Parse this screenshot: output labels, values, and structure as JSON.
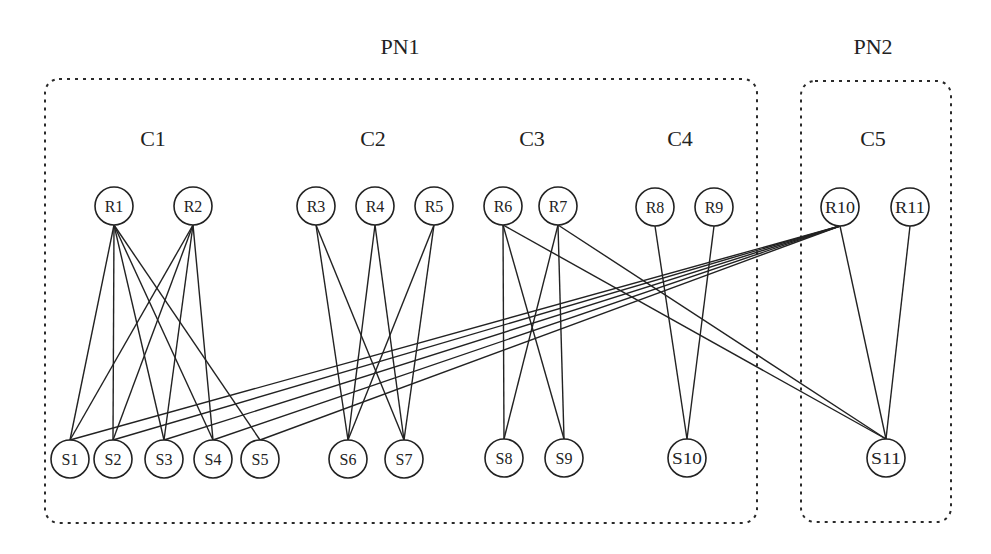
{
  "diagram": {
    "groups": [
      {
        "id": "PN1",
        "label": "PN1",
        "x": 45,
        "y": 79,
        "w": 712,
        "h": 444,
        "label_x": 400,
        "label_y": 54
      },
      {
        "id": "PN2",
        "label": "PN2",
        "x": 801,
        "y": 81,
        "w": 150,
        "h": 441,
        "label_x": 873,
        "label_y": 54
      }
    ],
    "clusters": [
      {
        "id": "C1",
        "label": "C1",
        "x": 153,
        "y": 146
      },
      {
        "id": "C2",
        "label": "C2",
        "x": 373,
        "y": 146
      },
      {
        "id": "C3",
        "label": "C3",
        "x": 532,
        "y": 146
      },
      {
        "id": "C4",
        "label": "C4",
        "x": 680,
        "y": 146
      },
      {
        "id": "C5",
        "label": "C5",
        "x": 873,
        "y": 146
      }
    ],
    "node_radius": 19,
    "nodes": [
      {
        "id": "R1",
        "label": "R1",
        "x": 114,
        "y": 206
      },
      {
        "id": "R2",
        "label": "R2",
        "x": 193,
        "y": 206
      },
      {
        "id": "R3",
        "label": "R3",
        "x": 316,
        "y": 206
      },
      {
        "id": "R4",
        "label": "R4",
        "x": 375,
        "y": 206
      },
      {
        "id": "R5",
        "label": "R5",
        "x": 434,
        "y": 206
      },
      {
        "id": "R6",
        "label": "R6",
        "x": 503,
        "y": 206
      },
      {
        "id": "R7",
        "label": "R7",
        "x": 558,
        "y": 206
      },
      {
        "id": "R8",
        "label": "R8",
        "x": 655,
        "y": 207
      },
      {
        "id": "R9",
        "label": "R9",
        "x": 714,
        "y": 207
      },
      {
        "id": "R10",
        "label": "R10",
        "x": 840,
        "y": 207
      },
      {
        "id": "R11",
        "label": "R11",
        "x": 910,
        "y": 207
      },
      {
        "id": "S1",
        "label": "S1",
        "x": 70,
        "y": 459
      },
      {
        "id": "S2",
        "label": "S2",
        "x": 113,
        "y": 459
      },
      {
        "id": "S3",
        "label": "S3",
        "x": 164,
        "y": 459
      },
      {
        "id": "S4",
        "label": "S4",
        "x": 213,
        "y": 459
      },
      {
        "id": "S5",
        "label": "S5",
        "x": 260,
        "y": 459
      },
      {
        "id": "S6",
        "label": "S6",
        "x": 348,
        "y": 459
      },
      {
        "id": "S7",
        "label": "S7",
        "x": 404,
        "y": 459
      },
      {
        "id": "S8",
        "label": "S8",
        "x": 504,
        "y": 458
      },
      {
        "id": "S9",
        "label": "S9",
        "x": 564,
        "y": 458
      },
      {
        "id": "S10",
        "label": "S10",
        "x": 687,
        "y": 458
      },
      {
        "id": "S11",
        "label": "S11",
        "x": 886,
        "y": 458
      }
    ],
    "edges": [
      [
        "R1",
        "S1"
      ],
      [
        "R1",
        "S2"
      ],
      [
        "R1",
        "S3"
      ],
      [
        "R1",
        "S4"
      ],
      [
        "R1",
        "S5"
      ],
      [
        "R2",
        "S1"
      ],
      [
        "R2",
        "S2"
      ],
      [
        "R2",
        "S3"
      ],
      [
        "R2",
        "S4"
      ],
      [
        "R3",
        "S6"
      ],
      [
        "R3",
        "S7"
      ],
      [
        "R4",
        "S6"
      ],
      [
        "R4",
        "S7"
      ],
      [
        "R5",
        "S6"
      ],
      [
        "R5",
        "S7"
      ],
      [
        "R6",
        "S8"
      ],
      [
        "R6",
        "S9"
      ],
      [
        "R6",
        "S11"
      ],
      [
        "R7",
        "S8"
      ],
      [
        "R7",
        "S9"
      ],
      [
        "R7",
        "S11"
      ],
      [
        "R8",
        "S10"
      ],
      [
        "R9",
        "S10"
      ],
      [
        "R10",
        "S1"
      ],
      [
        "R10",
        "S2"
      ],
      [
        "R10",
        "S3"
      ],
      [
        "R10",
        "S4"
      ],
      [
        "R10",
        "S5"
      ],
      [
        "R10",
        "S11"
      ],
      [
        "R11",
        "S11"
      ]
    ]
  }
}
